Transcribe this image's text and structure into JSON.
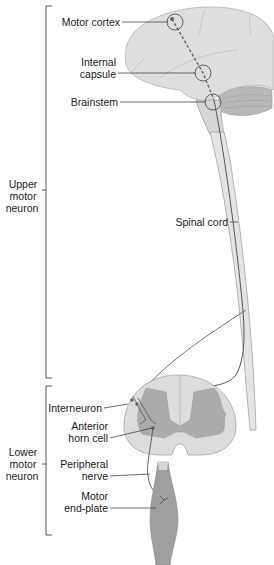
{
  "diagram": {
    "groups": {
      "upper": {
        "line1": "Upper",
        "line2": "motor",
        "line3": "neuron"
      },
      "lower": {
        "line1": "Lower",
        "line2": "motor",
        "line3": "neuron"
      }
    },
    "labels": {
      "motor_cortex": "Motor cortex",
      "internal_capsule_1": "Internal",
      "internal_capsule_2": "capsule",
      "brainstem": "Brainstem",
      "spinal_cord": "Spinal cord",
      "interneuron": "Interneuron",
      "anterior_horn_1": "Anterior",
      "anterior_horn_2": "horn cell",
      "peripheral_nerve_1": "Peripheral",
      "peripheral_nerve_2": "nerve",
      "motor_end_plate_1": "Motor",
      "motor_end_plate_2": "end-plate"
    },
    "colors": {
      "brain": "#dcdcdc",
      "cerebellum": "#bdbdbd",
      "cord_white": "#e2e2e2",
      "cord_grey": "#a9a9a9",
      "muscle": "#9c9c9c",
      "line": "#555555"
    }
  }
}
